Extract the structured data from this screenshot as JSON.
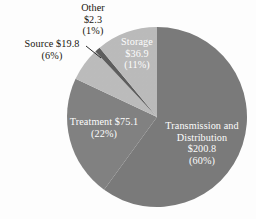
{
  "chart_data": {
    "type": "pie",
    "title": "",
    "subtitle": "",
    "xlabel": "",
    "ylabel": "",
    "legend_position": "none",
    "grid": false,
    "units": "billions of dollars",
    "total": 334.9,
    "start_angle_deg": 0,
    "direction": "clockwise",
    "categories": [
      "Transmission and Distribution",
      "Treatment",
      "Source",
      "Other",
      "Storage"
    ],
    "values": [
      200.8,
      75.1,
      19.8,
      2.3,
      36.9
    ],
    "percents": [
      60,
      22,
      6,
      1,
      11
    ],
    "colors": [
      "#7b7b7b",
      "#828282",
      "#bdbdbd",
      "#5e5e5e",
      "#bcbcbc"
    ],
    "slices": [
      {
        "name": "Transmission and Distribution",
        "value": 200.8,
        "percent": 60,
        "color": "#7b7b7b",
        "label_placement": "inside",
        "label_color": "#ffffff",
        "lines": [
          "Transmission and",
          "Distribution",
          "$200.8",
          "(60%)"
        ]
      },
      {
        "name": "Treatment",
        "value": 75.1,
        "percent": 22,
        "color": "#828282",
        "label_placement": "inside",
        "label_color": "#ffffff",
        "lines": [
          "Treatment $75.1",
          "(22%)"
        ]
      },
      {
        "name": "Source",
        "value": 19.8,
        "percent": 6,
        "color": "#bdbdbd",
        "label_placement": "outside",
        "label_color": "#19170f",
        "leader_line": true,
        "lines": [
          "Source $19.8",
          "(6%)"
        ]
      },
      {
        "name": "Other",
        "value": 2.3,
        "percent": 1,
        "color": "#5e5e5e",
        "label_placement": "outside",
        "label_color": "#19170f",
        "leader_line": false,
        "lines": [
          "Other",
          "$2.3",
          "(1%)"
        ]
      },
      {
        "name": "Storage",
        "value": 36.9,
        "percent": 11,
        "color": "#bcbcbc",
        "label_placement": "inside",
        "label_color": "#ffffff",
        "lines": [
          "Storage",
          "$36.9",
          "(11%)"
        ]
      }
    ]
  },
  "labels": {
    "other": {
      "line1": "Other",
      "line2": "$2.3",
      "line3": "(1%)"
    },
    "source": {
      "line1": "Source $19.8",
      "line2": "(6%)"
    },
    "storage": {
      "line1": "Storage",
      "line2": "$36.9",
      "line3": "(11%)"
    },
    "treatment": {
      "line1": "Treatment $75.1",
      "line2": "(22%)"
    },
    "transmission": {
      "line1": "Transmission and",
      "line2": "Distribution",
      "line3": "$200.8",
      "line4": "(60%)"
    }
  },
  "style": {
    "background": "#ffffff",
    "text_dark": "#19170f",
    "text_light": "#ffffff",
    "leader_line_color": "#2b2b2b"
  }
}
